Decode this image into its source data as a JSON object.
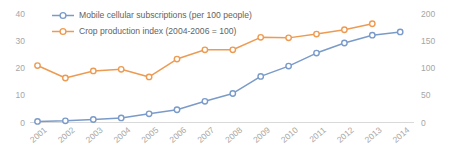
{
  "chart_data": {
    "type": "line",
    "title": "",
    "xlabel": "",
    "ylabel": "",
    "grid": false,
    "legend_position": "top-left",
    "categories": [
      "2001",
      "2002",
      "2003",
      "2004",
      "2005",
      "2006",
      "2007",
      "2008",
      "2009",
      "2010",
      "2011",
      "2012",
      "2013",
      "2014"
    ],
    "axes": {
      "left": {
        "ylim": [
          0,
          40
        ],
        "ticks": [
          0,
          10,
          20,
          30,
          40
        ],
        "tick_labels": [
          "0",
          "10",
          "20",
          "30",
          "40"
        ]
      },
      "right": {
        "ylim": [
          0,
          200
        ],
        "ticks": [
          0,
          50,
          100,
          150,
          200
        ],
        "tick_labels": [
          "0",
          "50",
          "100",
          "150",
          "200"
        ]
      }
    },
    "series": [
      {
        "name": "Mobile cellular subscriptions (per 100 people)",
        "axis": "left",
        "color": "#7a9bc9",
        "marker": "circle",
        "values": [
          0.4,
          0.6,
          1.1,
          1.7,
          3.2,
          4.7,
          7.8,
          10.7,
          17.0,
          20.8,
          25.6,
          29.3,
          32.2,
          33.4
        ]
      },
      {
        "name": "Crop production index (2004-2006 = 100)",
        "axis": "right",
        "color": "#ed9b52",
        "marker": "circle",
        "values": [
          105,
          82,
          95,
          98,
          84,
          117,
          134,
          134,
          157,
          156,
          163,
          171,
          182,
          null
        ]
      }
    ]
  },
  "colors": {
    "series_blue": "#7a9bc9",
    "series_orange": "#ed9b52",
    "axis_line": "#d9d9d9",
    "tick_text": "#a6a6a6",
    "legend_text": "#636363",
    "background": "#ffffff"
  }
}
